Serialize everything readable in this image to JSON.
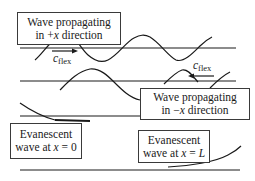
{
  "diagram": {
    "title": "",
    "colors": {
      "stroke": "#1a1a1a",
      "background": "#ffffff"
    },
    "labels": {
      "wave_pos": {
        "line1": "Wave propagating",
        "line2_pre": "in +",
        "line2_var": "x",
        "line2_post": " direction"
      },
      "wave_neg": {
        "line1": "Wave propagating",
        "line2_pre": "in −",
        "line2_var": "x",
        "line2_post": " direction"
      },
      "evan_0": {
        "line1": "Evanescent",
        "line2_pre": "wave at ",
        "line2_var": "x",
        "line2_post": " = 0"
      },
      "evan_L": {
        "line1": "Evanescent",
        "line2_pre": "wave at ",
        "line2_var": "x",
        "line2_post": " = ",
        "line2_var2": "L"
      }
    },
    "speed_labels": {
      "pos": {
        "symbol": "c",
        "subscript": "flex",
        "arrow_direction": "right"
      },
      "neg": {
        "symbol": "c",
        "subscript": "flex",
        "arrow_direction": "left"
      }
    }
  }
}
